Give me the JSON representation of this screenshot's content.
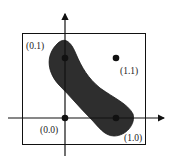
{
  "diagram": {
    "type": "xor-decision-region",
    "colors": {
      "ink": "#111111",
      "blob": "#2e2e2e",
      "background": "#ffffff",
      "caption": "#e2e2e2"
    },
    "points": [
      {
        "id": "p00",
        "label": "(0.0)",
        "x": 0,
        "y": 0
      },
      {
        "id": "p10",
        "label": "(1.0)",
        "x": 1,
        "y": 0
      },
      {
        "id": "p01",
        "label": "(0.1)",
        "x": 0,
        "y": 1
      },
      {
        "id": "p11",
        "label": "(1.1)",
        "x": 1,
        "y": 1
      }
    ],
    "caption": ""
  }
}
